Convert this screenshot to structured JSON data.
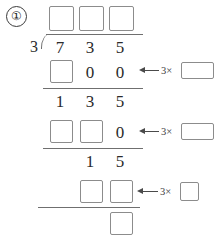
{
  "worksheet": {
    "problem_number": "①",
    "operation": "long-division",
    "divisor": "3",
    "dividend_digits": [
      "7",
      "3",
      "5"
    ],
    "quotient_boxes": [
      "",
      "",
      ""
    ],
    "steps": [
      {
        "product_row": [
          "",
          "0",
          "0"
        ],
        "product_row_box_count": 1,
        "remainder_row": [
          "1",
          "3",
          "5"
        ],
        "hint_label": "3×",
        "hint_box": "",
        "hint_box_shape": "wide"
      },
      {
        "product_row": [
          "",
          "",
          "0"
        ],
        "product_row_box_count": 2,
        "remainder_row": [
          "1",
          "5"
        ],
        "hint_label": "3×",
        "hint_box": "",
        "hint_box_shape": "wide"
      },
      {
        "product_row": [
          "",
          ""
        ],
        "product_row_box_count": 2,
        "remainder_row": [
          ""
        ],
        "hint_label": "3×",
        "hint_box": "",
        "hint_box_shape": "small"
      }
    ],
    "final_remainder_box": ""
  },
  "colors": {
    "ink": "#2b2b2b",
    "rule": "#6f6f6f",
    "box_border": "#8c8c8c",
    "arrow": "#4a4a4a",
    "background": "#ffffff"
  }
}
